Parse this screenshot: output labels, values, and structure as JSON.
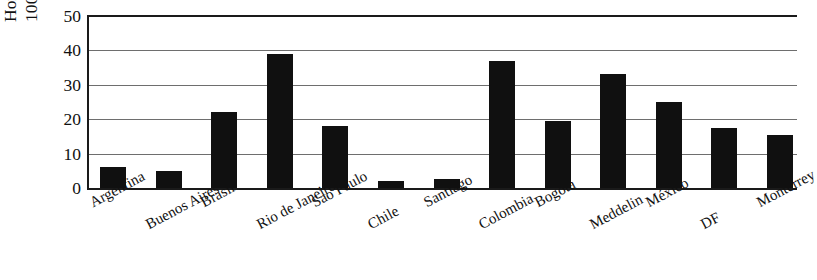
{
  "chart_data": {
    "type": "bar",
    "title": "",
    "subtitle": "",
    "xlabel": "",
    "ylabel": "Homicides per 100,000 Inhabitants",
    "ylabel_lines": [
      "Homicides per",
      "100,000 Inhabitants"
    ],
    "categories": [
      "Argentina",
      "Buenos Aires",
      "Brasil",
      "Rio de Janeiro",
      "Sao Paulo",
      "Chile",
      "Santiago",
      "Colombia",
      "Bogotá",
      "Meddelin",
      "México",
      "DF",
      "Monterrey"
    ],
    "values": [
      6,
      5,
      22,
      39,
      18,
      2,
      2.5,
      37,
      19.5,
      33,
      25,
      17.5,
      15.5
    ],
    "ylim": [
      0,
      50
    ],
    "yticks": [
      0,
      10,
      20,
      30,
      40,
      50
    ],
    "ytick_labels": [
      "0",
      "10",
      "20",
      "30",
      "40",
      "50"
    ],
    "grid": true,
    "grid_axis": "y",
    "legend": false,
    "legend_position": "none",
    "bar_color": "#101010",
    "grid_color": "#6e6e6e",
    "axis_color": "#1a1a1a",
    "background_color": "#ffffff",
    "xtick_rotation": -28,
    "xtick_stagger": true
  }
}
